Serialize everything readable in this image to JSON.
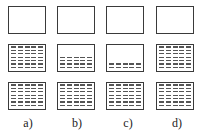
{
  "figure": {
    "columns": [
      {
        "label": "a)",
        "rows": [
          0,
          7,
          7
        ]
      },
      {
        "label": "b)",
        "rows": [
          0,
          4,
          7
        ]
      },
      {
        "label": "c)",
        "rows": [
          0,
          2,
          7
        ]
      },
      {
        "label": "d)",
        "rows": [
          0,
          7,
          7
        ]
      }
    ],
    "column_x": [
      8,
      57,
      106,
      156
    ],
    "row_y": [
      6,
      44,
      82
    ],
    "dash_columns": 5,
    "colors": {
      "border": "#3a3a3a",
      "dash": "#555555"
    }
  }
}
